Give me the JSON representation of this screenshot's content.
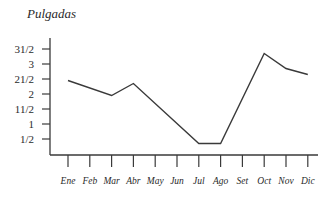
{
  "chart_data": {
    "type": "line",
    "title": "",
    "xlabel": "",
    "ylabel": "Pulgadas",
    "categories": [
      "Ene",
      "Feb",
      "Mar",
      "Abr",
      "May",
      "Jun",
      "Jul",
      "Ago",
      "Set",
      "Oct",
      "Nov",
      "Dic"
    ],
    "series": [
      {
        "name": "Pulgadas",
        "points": [
          {
            "x": "Ene",
            "y": 2.45
          },
          {
            "x": "Mar",
            "y": 1.95
          },
          {
            "x": "Abr",
            "y": 2.35
          },
          {
            "x": "Jul",
            "y": 0.35
          },
          {
            "x": "Ago",
            "y": 0.35
          },
          {
            "x": "Oct",
            "y": 3.35
          },
          {
            "x": "Nov",
            "y": 2.85
          },
          {
            "x": "Dic",
            "y": 2.65
          }
        ]
      }
    ],
    "y_ticks": [
      {
        "value": 0.5,
        "label": "1/2"
      },
      {
        "value": 1,
        "label": "1"
      },
      {
        "value": 1.5,
        "label": "11/2"
      },
      {
        "value": 2,
        "label": "2"
      },
      {
        "value": 2.5,
        "label": "21/2"
      },
      {
        "value": 3,
        "label": "3"
      },
      {
        "value": 3.5,
        "label": "31/2"
      }
    ],
    "ylim": [
      0,
      3.7
    ],
    "grid": false,
    "legend": "none",
    "line_color": "#3a3a3a"
  }
}
